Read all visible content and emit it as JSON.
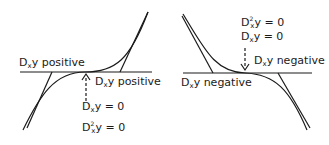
{
  "left_panel": {
    "title": "Increasing inflection point",
    "label_left": {
      "prefix": "D",
      "sub": "x",
      "suffix": "y positive"
    },
    "label_right": {
      "prefix": "D",
      "sub": "x",
      "suffix": "y positive"
    },
    "cond1": {
      "prefix": "D",
      "sub": "x",
      "suffix": "y = 0"
    },
    "cond2": {
      "prefix": "D",
      "sup": "2",
      "sub": "x",
      "suffix": "y = 0"
    }
  },
  "right_panel": {
    "title": "Decreasing inflection point",
    "cond2": {
      "prefix": "D",
      "sup": "2",
      "sub": "x",
      "suffix": "y = 0"
    },
    "cond1": {
      "prefix": "D",
      "sub": "x",
      "suffix": "y = 0"
    },
    "label_right": {
      "prefix": "D",
      "sub": "x",
      "suffix": "y negative"
    },
    "label_left": {
      "prefix": "D",
      "sub": "x",
      "suffix": "y negative"
    }
  },
  "colors": {
    "ink": "#1a1a1a",
    "background": "#ffffff"
  }
}
